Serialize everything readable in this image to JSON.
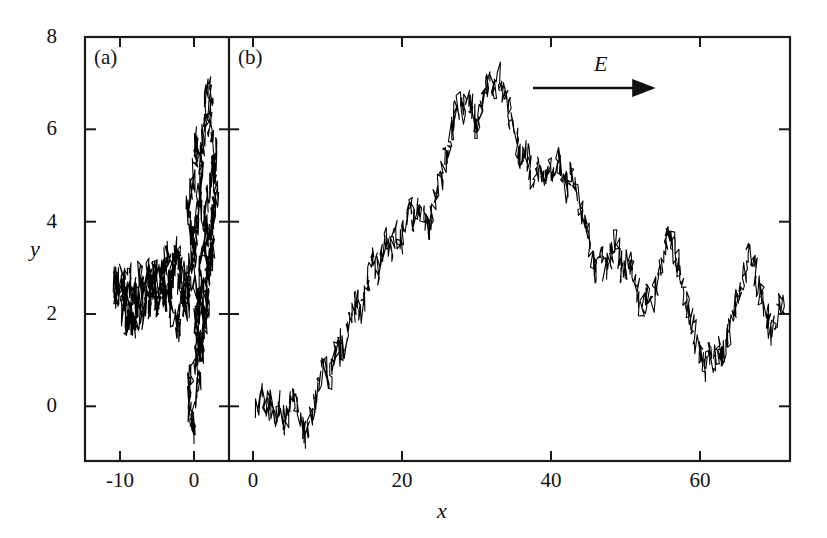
{
  "figure": {
    "background_color": "#ffffff",
    "line_color": "#000000",
    "frame_color": "#1a1a1a"
  },
  "panels": {
    "a": {
      "label": "(a)"
    },
    "b": {
      "label": "(b)"
    }
  },
  "annotations": {
    "field_label": "E",
    "field_arrow": "right-arrow-icon"
  },
  "axes": {
    "y_title": "y",
    "x_title": "x",
    "y_ticks": [
      "0",
      "2",
      "4",
      "6",
      "8"
    ],
    "x_ticks_a": [
      "-10",
      "0"
    ],
    "x_ticks_b": [
      "0",
      "20",
      "40",
      "60"
    ]
  },
  "chart_data": {
    "type": "line",
    "title": "",
    "xlabel": "x",
    "ylabel": "y",
    "grid": false,
    "legend": "none",
    "panels": [
      {
        "name": "(a)",
        "description": "Isotropic random walk, no field",
        "xlim": [
          -12.5,
          4.5
        ],
        "ylim": [
          -1.0,
          8.0
        ],
        "xticks": [
          -10,
          0
        ],
        "yticks": [
          0,
          2,
          4,
          6,
          8
        ],
        "x": [
          -0.3,
          -0.9,
          -1.4,
          -1.0,
          -1.7,
          -2.3,
          -2.0,
          -2.7,
          -3.3,
          -3.0,
          -3.6,
          -4.2,
          -3.8,
          -4.3,
          -4.9,
          -5.4,
          -5.0,
          -5.6,
          -6.1,
          -5.7,
          -6.3,
          -6.9,
          -7.4,
          -7.0,
          -7.6,
          -8.2,
          -7.8,
          -8.4,
          -9.0,
          -9.5,
          -9.1,
          -9.7,
          -10.2,
          -10.7,
          -10.3,
          -10.8,
          -10.4,
          -9.9,
          -9.4,
          -9.8,
          -9.3,
          -8.8,
          -9.2,
          -8.7,
          -8.2,
          -8.6,
          -8.1,
          -7.6,
          -8.0,
          -7.5,
          -7.0,
          -6.5,
          -6.9,
          -6.4,
          -5.9,
          -6.3,
          -5.8,
          -5.3,
          -5.7,
          -5.2,
          -4.7,
          -4.2,
          -4.6,
          -4.1,
          -3.6,
          -4.0,
          -3.5,
          -3.0,
          -3.4,
          -2.9,
          -2.4,
          -2.8,
          -2.3,
          -1.8,
          -2.2,
          -1.7,
          -1.2,
          -1.6,
          -1.1,
          -0.6,
          -1.0,
          -0.5,
          0.0,
          -0.4,
          0.1,
          0.6,
          0.2,
          0.7,
          1.2,
          0.8,
          1.3,
          1.8,
          1.4,
          1.9,
          2.4,
          2.0,
          2.5,
          3.0,
          2.6,
          3.1,
          2.7,
          2.2,
          2.6,
          2.1,
          1.6,
          2.0,
          1.5,
          1.0,
          1.4,
          0.9,
          0.4,
          0.8,
          0.3,
          -0.2,
          0.2,
          -0.3,
          -0.8,
          -0.4,
          0.1,
          0.6,
          0.2,
          0.7,
          1.2,
          0.8,
          1.3,
          1.8,
          1.4,
          1.9,
          2.4,
          2.9,
          2.5,
          3.0,
          2.6,
          2.1,
          2.5,
          2.0,
          1.5,
          1.9,
          1.4,
          0.9,
          1.3,
          0.8,
          0.3,
          0.7,
          0.2,
          -0.3,
          0.1,
          -0.4,
          -0.9,
          -0.5,
          0.0,
          0.5,
          0.1,
          0.6,
          1.1,
          0.7,
          1.2,
          1.7,
          1.3,
          1.8,
          2.3,
          1.9,
          2.4,
          2.0,
          1.5,
          1.0,
          1.4,
          0.9
        ],
        "y": [
          2.6,
          2.9,
          2.5,
          2.1,
          2.4,
          2.0,
          1.6,
          1.9,
          2.3,
          2.7,
          2.3,
          2.6,
          2.2,
          2.6,
          2.2,
          2.6,
          2.2,
          2.5,
          2.1,
          2.5,
          2.9,
          2.5,
          2.9,
          2.5,
          2.2,
          2.6,
          2.2,
          2.6,
          3.0,
          2.6,
          2.3,
          2.7,
          2.3,
          2.7,
          2.4,
          2.8,
          2.4,
          2.8,
          2.4,
          2.0,
          2.4,
          2.0,
          1.7,
          2.1,
          1.7,
          2.1,
          1.7,
          2.1,
          2.5,
          2.1,
          1.8,
          2.2,
          2.6,
          2.2,
          2.6,
          3.0,
          2.6,
          3.0,
          2.6,
          3.0,
          2.6,
          3.0,
          2.6,
          3.0,
          3.4,
          3.0,
          3.4,
          3.0,
          2.6,
          3.0,
          3.4,
          3.0,
          3.4,
          3.0,
          2.6,
          3.0,
          2.6,
          2.2,
          2.6,
          2.2,
          2.6,
          3.0,
          3.4,
          3.8,
          3.4,
          3.8,
          4.2,
          4.6,
          5.0,
          5.4,
          5.8,
          6.2,
          6.6,
          7.0,
          6.6,
          6.2,
          5.8,
          5.4,
          5.0,
          4.6,
          4.2,
          3.8,
          3.4,
          3.0,
          2.6,
          2.2,
          1.8,
          2.2,
          1.8,
          1.4,
          1.0,
          0.6,
          0.2,
          -0.2,
          -0.6,
          -0.2,
          0.2,
          0.6,
          1.0,
          1.4,
          1.8,
          2.2,
          2.6,
          3.0,
          3.4,
          3.8,
          4.2,
          4.6,
          5.0,
          5.4,
          5.0,
          4.6,
          4.2,
          3.8,
          3.4,
          3.0,
          2.6,
          2.2,
          1.8,
          1.4,
          1.0,
          1.4,
          1.8,
          2.2,
          2.6,
          3.0,
          3.4,
          3.8,
          4.2,
          4.6,
          5.0,
          5.4,
          5.8,
          5.4,
          5.0,
          4.6,
          4.2,
          3.8,
          3.4,
          3.0
        ]
      },
      {
        "name": "(b)",
        "description": "Biased random walk with drift along field E",
        "xlim": [
          -1.0,
          72.0
        ],
        "ylim": [
          -1.0,
          8.0
        ],
        "xticks": [
          0,
          20,
          40,
          60
        ],
        "yticks": [
          0,
          2,
          4,
          6,
          8
        ],
        "x": [
          0.5,
          1.2,
          1.8,
          2.4,
          3.0,
          3.6,
          4.2,
          4.8,
          5.4,
          6.0,
          6.6,
          7.2,
          7.8,
          8.4,
          9.0,
          9.6,
          10.2,
          10.8,
          11.4,
          12.0,
          12.6,
          13.2,
          13.8,
          14.4,
          15.0,
          15.6,
          16.2,
          16.8,
          17.4,
          18.0,
          18.6,
          19.2,
          19.8,
          20.4,
          21.0,
          21.6,
          22.2,
          22.8,
          23.4,
          24.0,
          24.6,
          25.2,
          25.8,
          26.4,
          27.0,
          27.6,
          28.2,
          28.8,
          29.4,
          30.0,
          30.6,
          31.2,
          31.8,
          32.4,
          33.0,
          33.6,
          34.2,
          34.8,
          35.4,
          36.0,
          36.6,
          37.2,
          37.8,
          38.4,
          39.0,
          39.6,
          40.2,
          40.8,
          41.4,
          42.0,
          42.6,
          43.2,
          43.8,
          44.4,
          45.0,
          45.6,
          46.2,
          46.8,
          47.4,
          48.0,
          48.6,
          49.2,
          49.8,
          50.4,
          51.0,
          51.6,
          52.2,
          52.8,
          53.4,
          54.0,
          54.6,
          55.2,
          55.8,
          56.4,
          57.0,
          57.6,
          58.2,
          58.8,
          59.4,
          60.0,
          60.6,
          61.2,
          61.8,
          62.4,
          63.0,
          63.6,
          64.2,
          64.8,
          65.4,
          66.0,
          66.6,
          67.2,
          67.8,
          68.4,
          69.0,
          69.6,
          70.2,
          70.8,
          71.4
        ],
        "y": [
          0.0,
          0.3,
          -0.1,
          0.2,
          -0.3,
          0.1,
          -0.4,
          -0.1,
          0.3,
          0.0,
          -0.4,
          -0.7,
          -0.3,
          0.1,
          0.5,
          0.9,
          0.6,
          1.0,
          1.4,
          1.1,
          1.5,
          1.9,
          2.3,
          2.0,
          2.4,
          2.8,
          3.2,
          2.9,
          3.3,
          3.7,
          3.4,
          3.8,
          3.5,
          3.9,
          4.3,
          4.0,
          4.4,
          4.1,
          3.8,
          4.2,
          4.6,
          5.0,
          5.4,
          5.8,
          6.2,
          6.6,
          6.3,
          6.7,
          6.4,
          6.0,
          6.4,
          6.8,
          7.1,
          6.8,
          7.2,
          6.9,
          6.5,
          6.1,
          5.7,
          5.3,
          5.6,
          5.2,
          4.8,
          5.2,
          4.9,
          5.3,
          5.0,
          5.4,
          5.1,
          4.7,
          5.1,
          4.8,
          4.4,
          4.0,
          3.6,
          3.2,
          2.8,
          3.2,
          2.9,
          3.3,
          3.6,
          3.2,
          2.8,
          3.2,
          2.9,
          2.5,
          2.1,
          2.5,
          2.2,
          2.6,
          3.0,
          3.4,
          3.8,
          3.5,
          3.1,
          2.7,
          2.3,
          1.9,
          1.5,
          1.1,
          0.8,
          1.2,
          0.9,
          1.3,
          1.0,
          1.4,
          1.8,
          2.2,
          2.6,
          3.0,
          3.4,
          3.1,
          2.7,
          2.3,
          1.9,
          1.5,
          1.9,
          2.3,
          2.0
        ]
      }
    ]
  }
}
